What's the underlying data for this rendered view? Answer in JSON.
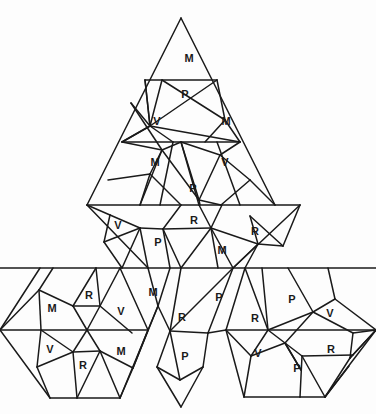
{
  "diagram": {
    "title": "",
    "stroke_color": "#1a1a1a",
    "background": "#fdfdfd",
    "segments": [
      [
        181,
        18,
        87,
        205
      ],
      [
        181,
        18,
        275,
        205
      ],
      [
        145,
        80,
        217,
        80
      ],
      [
        122,
        142,
        240,
        142
      ],
      [
        87,
        205,
        300,
        205
      ],
      [
        145,
        80,
        150,
        126
      ],
      [
        150,
        126,
        217,
        80
      ],
      [
        145,
        80,
        150,
        126
      ],
      [
        150,
        126,
        240,
        142
      ],
      [
        150,
        126,
        122,
        142
      ],
      [
        150,
        126,
        162,
        80
      ],
      [
        122,
        142,
        150,
        126
      ],
      [
        150,
        126,
        173,
        142
      ],
      [
        131,
        103,
        150,
        126
      ],
      [
        131,
        103,
        162,
        150
      ],
      [
        217,
        80,
        225,
        120
      ],
      [
        225,
        120,
        240,
        142
      ],
      [
        225,
        120,
        162,
        80
      ],
      [
        225,
        120,
        205,
        142
      ],
      [
        162,
        150,
        181,
        142
      ],
      [
        162,
        150,
        140,
        205
      ],
      [
        162,
        150,
        122,
        142
      ],
      [
        162,
        150,
        150,
        174
      ],
      [
        150,
        174,
        140,
        205
      ],
      [
        150,
        174,
        108,
        180
      ],
      [
        162,
        150,
        199,
        200
      ],
      [
        199,
        200,
        181,
        142
      ],
      [
        199,
        200,
        221,
        205
      ],
      [
        199,
        200,
        200,
        205
      ],
      [
        220,
        155,
        199,
        200
      ],
      [
        220,
        155,
        240,
        142
      ],
      [
        220,
        155,
        250,
        180
      ],
      [
        250,
        180,
        275,
        205
      ],
      [
        220,
        155,
        181,
        142
      ],
      [
        173,
        142,
        160,
        205
      ],
      [
        181,
        142,
        199,
        205
      ],
      [
        217,
        142,
        240,
        205
      ],
      [
        150,
        174,
        181,
        205
      ],
      [
        221,
        205,
        250,
        180
      ],
      [
        87,
        205,
        148,
        268
      ],
      [
        300,
        205,
        233,
        268
      ],
      [
        110,
        215,
        87,
        205
      ],
      [
        110,
        215,
        104,
        242
      ],
      [
        104,
        242,
        140,
        228
      ],
      [
        140,
        228,
        110,
        215
      ],
      [
        140,
        228,
        148,
        268
      ],
      [
        140,
        228,
        163,
        229
      ],
      [
        163,
        229,
        181,
        205
      ],
      [
        163,
        229,
        170,
        268
      ],
      [
        163,
        229,
        211,
        228
      ],
      [
        211,
        228,
        199,
        205
      ],
      [
        211,
        228,
        222,
        205
      ],
      [
        211,
        228,
        218,
        268
      ],
      [
        211,
        228,
        258,
        244
      ],
      [
        258,
        244,
        250,
        216
      ],
      [
        250,
        216,
        283,
        246
      ],
      [
        283,
        246,
        258,
        244
      ],
      [
        258,
        244,
        233,
        268
      ],
      [
        258,
        244,
        245,
        268
      ],
      [
        283,
        246,
        300,
        205
      ],
      [
        0,
        268,
        376,
        268
      ],
      [
        122,
        268,
        140,
        228
      ],
      [
        181,
        268,
        163,
        229
      ],
      [
        181,
        268,
        211,
        228
      ],
      [
        233,
        268,
        211,
        228
      ],
      [
        104,
        242,
        122,
        268
      ],
      [
        40,
        268,
        0,
        330
      ],
      [
        0,
        330,
        50,
        398
      ],
      [
        50,
        398,
        120,
        398
      ],
      [
        120,
        398,
        148,
        330
      ],
      [
        148,
        330,
        120,
        268
      ],
      [
        0,
        330,
        148,
        330
      ],
      [
        39,
        290,
        53,
        268
      ],
      [
        39,
        290,
        73,
        306
      ],
      [
        73,
        306,
        96,
        268
      ],
      [
        73,
        306,
        100,
        306
      ],
      [
        100,
        306,
        96,
        268
      ],
      [
        100,
        306,
        120,
        268
      ],
      [
        100,
        306,
        132,
        333
      ],
      [
        73,
        306,
        87,
        330
      ],
      [
        100,
        306,
        87,
        330
      ],
      [
        39,
        290,
        41,
        330
      ],
      [
        39,
        290,
        0,
        330
      ],
      [
        41,
        330,
        73,
        352
      ],
      [
        41,
        330,
        37,
        367
      ],
      [
        37,
        367,
        73,
        352
      ],
      [
        37,
        367,
        50,
        398
      ],
      [
        73,
        352,
        77,
        398
      ],
      [
        73,
        352,
        100,
        351
      ],
      [
        100,
        351,
        77,
        398
      ],
      [
        100,
        351,
        87,
        330
      ],
      [
        100,
        351,
        133,
        368
      ],
      [
        133,
        368,
        148,
        330
      ],
      [
        133,
        368,
        120,
        398
      ],
      [
        100,
        351,
        120,
        398
      ],
      [
        73,
        352,
        87,
        330
      ],
      [
        148,
        268,
        158,
        306
      ],
      [
        158,
        306,
        170,
        268
      ],
      [
        158,
        306,
        133,
        368
      ],
      [
        158,
        306,
        148,
        330
      ],
      [
        158,
        306,
        170,
        331
      ],
      [
        170,
        331,
        181,
        268
      ],
      [
        170,
        331,
        233,
        268
      ],
      [
        170,
        331,
        180,
        380
      ],
      [
        180,
        380,
        157,
        367
      ],
      [
        157,
        367,
        170,
        331
      ],
      [
        157,
        367,
        181,
        407
      ],
      [
        181,
        407,
        203,
        367
      ],
      [
        203,
        367,
        180,
        380
      ],
      [
        203,
        367,
        208,
        333
      ],
      [
        208,
        333,
        170,
        331
      ],
      [
        208,
        333,
        233,
        268
      ],
      [
        208,
        333,
        226,
        330
      ],
      [
        226,
        330,
        245,
        268
      ],
      [
        226,
        330,
        268,
        330
      ],
      [
        262,
        268,
        268,
        330
      ],
      [
        268,
        330,
        245,
        268
      ],
      [
        268,
        330,
        313,
        312
      ],
      [
        313,
        312,
        288,
        268
      ],
      [
        313,
        312,
        335,
        299
      ],
      [
        335,
        299,
        328,
        268
      ],
      [
        335,
        299,
        376,
        330
      ],
      [
        313,
        312,
        353,
        333
      ],
      [
        353,
        333,
        376,
        330
      ],
      [
        353,
        333,
        350,
        358
      ],
      [
        350,
        358,
        376,
        330
      ],
      [
        350,
        358,
        325,
        397
      ],
      [
        325,
        397,
        349,
        366
      ],
      [
        268,
        330,
        251,
        356
      ],
      [
        251,
        356,
        226,
        330
      ],
      [
        251,
        356,
        285,
        343
      ],
      [
        285,
        343,
        268,
        330
      ],
      [
        285,
        343,
        301,
        370
      ],
      [
        301,
        370,
        285,
        343
      ],
      [
        285,
        343,
        302,
        356
      ],
      [
        302,
        356,
        353,
        355
      ],
      [
        302,
        356,
        300,
        397
      ],
      [
        300,
        397,
        325,
        397
      ],
      [
        302,
        356,
        325,
        397
      ],
      [
        251,
        356,
        244,
        397
      ],
      [
        244,
        397,
        300,
        397
      ],
      [
        244,
        397,
        226,
        330
      ],
      [
        285,
        343,
        313,
        312
      ],
      [
        268,
        330,
        376,
        330
      ],
      [
        350,
        358,
        376,
        330
      ],
      [
        325,
        397,
        376,
        330
      ]
    ],
    "labels": [
      {
        "text": "M",
        "x": 189,
        "y": 58
      },
      {
        "text": "P",
        "x": 185,
        "y": 94
      },
      {
        "text": "V",
        "x": 157,
        "y": 121
      },
      {
        "text": "M",
        "x": 226,
        "y": 121
      },
      {
        "text": "M",
        "x": 155,
        "y": 162
      },
      {
        "text": "V",
        "x": 225,
        "y": 162
      },
      {
        "text": "P",
        "x": 193,
        "y": 188
      },
      {
        "text": "R",
        "x": 194,
        "y": 220
      },
      {
        "text": "V",
        "x": 118,
        "y": 225
      },
      {
        "text": "R",
        "x": 255,
        "y": 231
      },
      {
        "text": "P",
        "x": 158,
        "y": 242
      },
      {
        "text": "M",
        "x": 222,
        "y": 250
      },
      {
        "text": "R",
        "x": 89,
        "y": 295
      },
      {
        "text": "M",
        "x": 52,
        "y": 308
      },
      {
        "text": "V",
        "x": 121,
        "y": 311
      },
      {
        "text": "M",
        "x": 153,
        "y": 292
      },
      {
        "text": "P",
        "x": 219,
        "y": 297
      },
      {
        "text": "P",
        "x": 292,
        "y": 299
      },
      {
        "text": "V",
        "x": 330,
        "y": 313
      },
      {
        "text": "R",
        "x": 182,
        "y": 317
      },
      {
        "text": "R",
        "x": 255,
        "y": 318
      },
      {
        "text": "V",
        "x": 50,
        "y": 349
      },
      {
        "text": "R",
        "x": 83,
        "y": 365
      },
      {
        "text": "M",
        "x": 121,
        "y": 351
      },
      {
        "text": "P",
        "x": 185,
        "y": 356
      },
      {
        "text": "V",
        "x": 258,
        "y": 353
      },
      {
        "text": "R",
        "x": 331,
        "y": 349
      },
      {
        "text": "P",
        "x": 297,
        "y": 368
      }
    ]
  }
}
